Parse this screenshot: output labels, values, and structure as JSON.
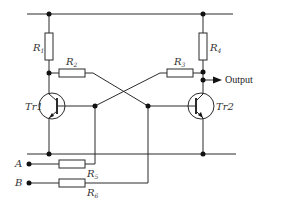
{
  "diagram": {
    "type": "circuit-schematic",
    "components": {
      "resistors": [
        {
          "id": "R1",
          "label": "R",
          "subscript": "1",
          "orientation": "vertical",
          "role": "Tr1 collector load"
        },
        {
          "id": "R2",
          "label": "R",
          "subscript": "2",
          "orientation": "horizontal",
          "role": "cross-coupling from Tr1 collector"
        },
        {
          "id": "R3",
          "label": "R",
          "subscript": "3",
          "orientation": "horizontal",
          "role": "cross-coupling from Tr2 collector"
        },
        {
          "id": "R4",
          "label": "R",
          "subscript": "4",
          "orientation": "vertical",
          "role": "Tr2 collector load"
        },
        {
          "id": "R5",
          "label": "R",
          "subscript": "5",
          "orientation": "horizontal",
          "role": "input A resistor"
        },
        {
          "id": "R6",
          "label": "R",
          "subscript": "6",
          "orientation": "horizontal",
          "role": "input B resistor"
        }
      ],
      "transistors": [
        {
          "id": "Tr1",
          "label": "Tr1"
        },
        {
          "id": "Tr2",
          "label": "Tr2"
        }
      ],
      "inputs": [
        {
          "id": "A",
          "label": "A"
        },
        {
          "id": "B",
          "label": "B"
        }
      ],
      "output": {
        "label": "Output"
      }
    },
    "labels": {
      "r1_main": "R",
      "r1_sub": "1",
      "r2_main": "R",
      "r2_sub": "2",
      "r3_main": "R",
      "r3_sub": "3",
      "r4_main": "R",
      "r4_sub": "4",
      "r5_main": "R",
      "r5_sub": "5",
      "r6_main": "R",
      "r6_sub": "6",
      "tr1": "Tr1",
      "tr2": "Tr2",
      "input_a": "A",
      "input_b": "B",
      "output": "Output"
    },
    "colors": {
      "line": "#2b2b2b",
      "node": "#111111",
      "background": "#ffffff"
    }
  }
}
